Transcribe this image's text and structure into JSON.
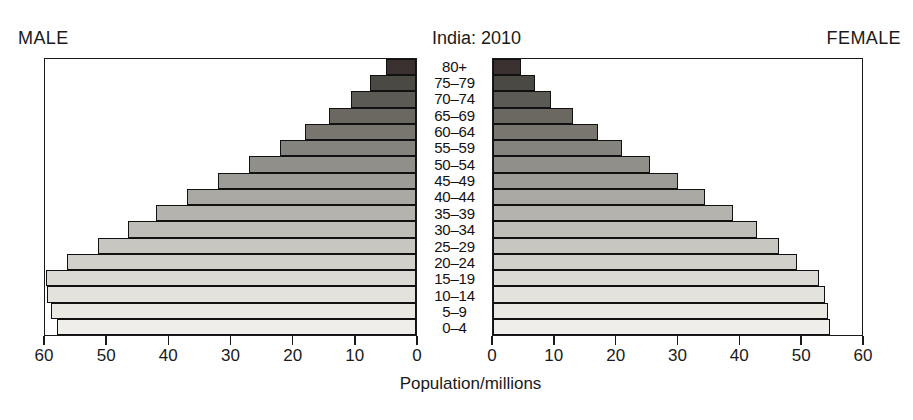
{
  "header": {
    "male_label": "MALE",
    "female_label": "FEMALE",
    "title": "India: 2010"
  },
  "axis": {
    "x_title": "Population/millions",
    "male_ticks": [
      "60",
      "50",
      "40",
      "30",
      "20",
      "10",
      "0"
    ],
    "female_ticks": [
      "0",
      "10",
      "20",
      "30",
      "40",
      "50",
      "60"
    ]
  },
  "chart_data": {
    "type": "bar",
    "subtype": "population-pyramid",
    "title": "India: 2010",
    "xlabel": "Population/millions",
    "ylabel": "",
    "xlim": [
      0,
      60
    ],
    "grid": false,
    "legend": false,
    "categories": [
      "0-4",
      "5-9",
      "10-14",
      "15-19",
      "20-24",
      "25-29",
      "30-34",
      "35-39",
      "40-44",
      "45-49",
      "50-54",
      "55-59",
      "60-64",
      "65-69",
      "70-74",
      "75-79",
      "80+"
    ],
    "series": [
      {
        "name": "MALE",
        "side": "left",
        "values": [
          58.0,
          59.0,
          59.6,
          59.8,
          56.5,
          51.5,
          46.5,
          42.0,
          37.0,
          32.0,
          27.0,
          22.0,
          18.0,
          14.0,
          10.5,
          7.5,
          4.9
        ]
      },
      {
        "name": "FEMALE",
        "side": "right",
        "values": [
          54.8,
          54.5,
          54.0,
          53.0,
          49.5,
          46.5,
          43.0,
          39.0,
          34.5,
          30.0,
          25.5,
          21.0,
          17.0,
          13.0,
          9.5,
          6.8,
          4.6
        ]
      }
    ],
    "bar_colors": [
      "#f0eeea",
      "#eae8e3",
      "#e4e2dc",
      "#dcdad4",
      "#d2d0ca",
      "#c8c6c0",
      "#bfbdb7",
      "#b5b3ad",
      "#aaa8a2",
      "#9e9c96",
      "#918f89",
      "#85837d",
      "#78766f",
      "#6a6861",
      "#5c5a54",
      "#4b4944",
      "#3a3030"
    ]
  }
}
